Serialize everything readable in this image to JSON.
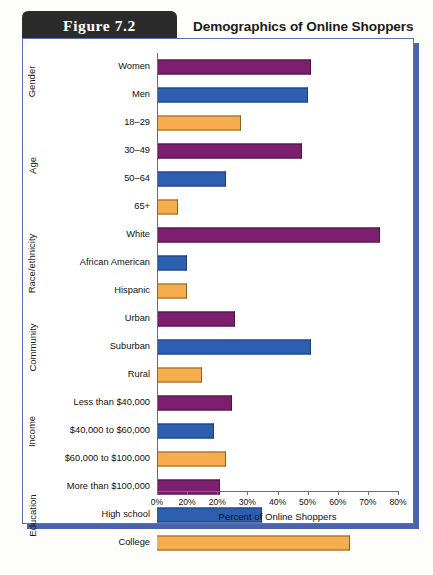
{
  "header": {
    "figure_tab": "Figure 7.2",
    "title": "Demographics of Online Shoppers"
  },
  "chart_data": {
    "type": "bar",
    "orientation": "horizontal",
    "title": "Demographics of Online Shoppers",
    "xlabel": "Percent of Online Shoppers",
    "ylabel": "",
    "xlim": [
      0,
      80
    ],
    "xticks": [
      0,
      10,
      20,
      30,
      40,
      50,
      60,
      70,
      80
    ],
    "xticklabels": [
      "0%",
      "20%",
      "20%",
      "30%",
      "40%",
      "50%",
      "60%",
      "70%",
      "80%"
    ],
    "grid": false,
    "legend": "none",
    "groups": [
      {
        "name": "Gender",
        "items": [
          {
            "label": "Women",
            "value": 51,
            "color": "#7b1f6e",
            "color_name": "purple"
          },
          {
            "label": "Men",
            "value": 50,
            "color": "#2c5fb0",
            "color_name": "blue"
          }
        ]
      },
      {
        "name": "Age",
        "items": [
          {
            "label": "18–29",
            "value": 28,
            "color": "#f6ad4e",
            "color_name": "orange"
          },
          {
            "label": "30–49",
            "value": 48,
            "color": "#7b1f6e",
            "color_name": "purple"
          },
          {
            "label": "50–64",
            "value": 23,
            "color": "#2c5fb0",
            "color_name": "blue"
          },
          {
            "label": "65+",
            "value": 7,
            "color": "#f6ad4e",
            "color_name": "orange"
          }
        ]
      },
      {
        "name": "Race/ethnicity",
        "items": [
          {
            "label": "White",
            "value": 74,
            "color": "#7b1f6e",
            "color_name": "purple"
          },
          {
            "label": "African American",
            "value": 10,
            "color": "#2c5fb0",
            "color_name": "blue"
          },
          {
            "label": "Hispanic",
            "value": 10,
            "color": "#f6ad4e",
            "color_name": "orange"
          }
        ]
      },
      {
        "name": "Community",
        "items": [
          {
            "label": "Urban",
            "value": 26,
            "color": "#7b1f6e",
            "color_name": "purple"
          },
          {
            "label": "Suburban",
            "value": 51,
            "color": "#2c5fb0",
            "color_name": "blue"
          },
          {
            "label": "Rural",
            "value": 15,
            "color": "#f6ad4e",
            "color_name": "orange"
          }
        ]
      },
      {
        "name": "Income",
        "items": [
          {
            "label": "Less than $40,000",
            "value": 25,
            "color": "#7b1f6e",
            "color_name": "purple"
          },
          {
            "label": "$40,000 to $60,000",
            "value": 19,
            "color": "#2c5fb0",
            "color_name": "blue"
          },
          {
            "label": "$60,000 to $100,000",
            "value": 23,
            "color": "#f6ad4e",
            "color_name": "orange"
          }
        ]
      },
      {
        "name": "Education",
        "items": [
          {
            "label": "More than $100,000",
            "value": 21,
            "color": "#7b1f6e",
            "color_name": "purple"
          },
          {
            "label": "High school",
            "value": 35,
            "color": "#2c5fb0",
            "color_name": "blue"
          },
          {
            "label": "College",
            "value": 64,
            "color": "#f6ad4e",
            "color_name": "orange"
          }
        ]
      }
    ]
  }
}
